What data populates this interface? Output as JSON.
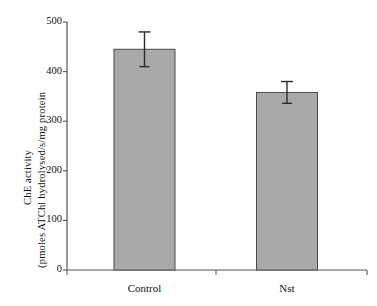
{
  "figure": {
    "background": "#ffffff",
    "bar_fill": "#a9a9a9",
    "bar_stroke": "#4a4a4a",
    "axis_color": "#555555",
    "error_color": "#2b2b2b"
  },
  "chart_data": {
    "type": "bar",
    "title": "",
    "xlabel": "",
    "ylabel_line1": "ChE activity",
    "ylabel_line2": "(pmoles ATChl hydrolysed/s/mg protein",
    "categories": [
      "Control",
      "Nst"
    ],
    "values": [
      445,
      358
    ],
    "errors": [
      35,
      22
    ],
    "error_type": "symmetric",
    "yticks": [
      0,
      100,
      200,
      300,
      400,
      500
    ],
    "ytick_labels": [
      "0",
      "100",
      "200",
      "300",
      "400",
      "500"
    ],
    "ylim": [
      0,
      500
    ],
    "grid": false,
    "legend": "none",
    "series": [
      {
        "name": "ChE activity",
        "values": [
          445,
          358
        ],
        "errors": [
          35,
          22
        ]
      }
    ]
  }
}
